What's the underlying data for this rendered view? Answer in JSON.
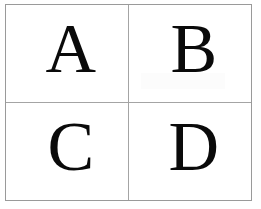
{
  "page": {
    "background_color": "#ffffff",
    "panel_border_color": "#9a9a9a",
    "divider_color": "#a4a4a4",
    "letter_color": "#0a0a0a"
  },
  "grid": {
    "rows": 2,
    "columns": 2,
    "cells": [
      {
        "id": "cell-a",
        "letter": "A",
        "row": 1,
        "column": 1
      },
      {
        "id": "cell-b",
        "letter": "B",
        "row": 1,
        "column": 2
      },
      {
        "id": "cell-c",
        "letter": "C",
        "row": 2,
        "column": 1
      },
      {
        "id": "cell-d",
        "letter": "D",
        "row": 2,
        "column": 2
      }
    ]
  }
}
